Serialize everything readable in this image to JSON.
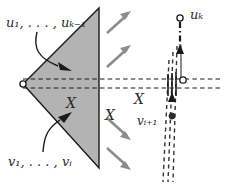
{
  "figure": {
    "background_color": "#ffffff",
    "cone": {
      "fill_color": "#b3b3b3",
      "stroke_color": "#1a1a1a",
      "apex_label": "o",
      "apex_point": [
        23,
        84
      ],
      "top_point": [
        99,
        8
      ],
      "bottom_point": [
        99,
        168
      ]
    },
    "labels": {
      "upper_generators": "u₁, . . . , uₖ₋₁",
      "lower_generators": "v₁, . . . , vᵢ",
      "uk": "uₖ",
      "vi_plus_1": "vᵢ₊₁",
      "x_inside": "X",
      "x_right": "X",
      "x_edge": "X"
    },
    "arrows": {
      "count": 4,
      "color": "#8c8c8c",
      "directions": [
        "up-right",
        "up-right",
        "down-right",
        "down-right"
      ]
    },
    "dashed_lines": {
      "color": "#1a1a1a",
      "horizontal_upper_y": 79,
      "horizontal_lower_y": 88,
      "vertical_count": 3
    },
    "markers": {
      "open_circle_apex": [
        23,
        84
      ],
      "open_circle_uk_top": [
        180,
        18
      ],
      "open_circle_axis": [
        182,
        80
      ],
      "filled_circle_vi1": [
        173,
        116
      ]
    }
  }
}
